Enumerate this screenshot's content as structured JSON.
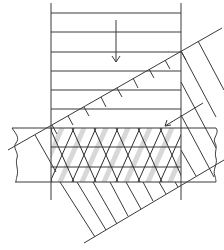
{
  "figure": {
    "colors": {
      "background": "#ffffff",
      "line": "#3a3a3a",
      "shade": "#c8c8c8"
    },
    "vertical_band": {
      "x_left": 51,
      "x_right": 181,
      "y_top": 3,
      "y_bottom": 200,
      "horizontal_lines_y": [
        13,
        32,
        52,
        71,
        90,
        109
      ],
      "arrow": {
        "direction": "down",
        "x": 116,
        "y_start": 20,
        "y_end": 62
      }
    },
    "layer_strip": {
      "x_left": 15,
      "x_right": 216,
      "lines_y": [
        128,
        147,
        167,
        182
      ],
      "break_lines": [
        "left-wavy",
        "right-wavy"
      ]
    },
    "inclined_band": {
      "upper_edge": {
        "x1": 8,
        "y1": 150,
        "x2": 222,
        "y2": 28
      },
      "lower_edge": {
        "x1": 84,
        "y1": 243,
        "x2": 224,
        "y2": 160
      },
      "arrow": {
        "direction": "down-left",
        "x1": 203,
        "y1": 103,
        "x2": 165,
        "y2": 126
      }
    }
  }
}
